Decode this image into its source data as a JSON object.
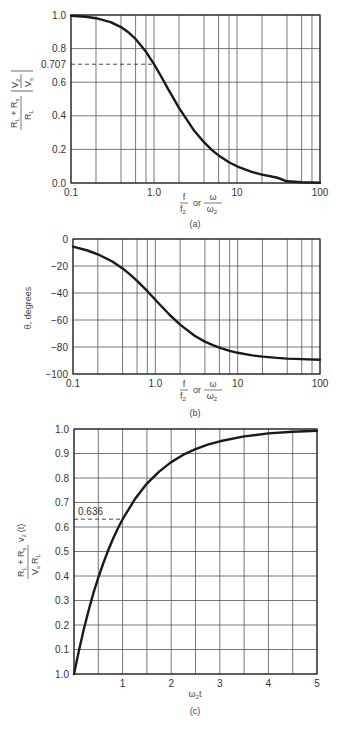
{
  "chart_data": [
    {
      "id": "a",
      "type": "line",
      "title": "",
      "caption": "(a)",
      "xscale": "log",
      "xlim": [
        0.1,
        100
      ],
      "ylim": [
        0.0,
        1.0
      ],
      "xticks": [
        {
          "v": 0.1,
          "label": "0.1"
        },
        {
          "v": 1,
          "label": "1.0"
        },
        {
          "v": 10,
          "label": "10"
        },
        {
          "v": 100,
          "label": "100"
        }
      ],
      "xgrid": [
        0.1,
        0.2,
        0.4,
        0.6,
        0.8,
        1,
        2,
        4,
        6,
        8,
        10,
        20,
        40,
        60,
        80,
        100
      ],
      "yticks": [
        {
          "v": 1.0,
          "label": "1.0"
        },
        {
          "v": 0.8,
          "label": "0.8"
        },
        {
          "v": 0.707,
          "label": "0.707"
        },
        {
          "v": 0.6,
          "label": "0.6"
        },
        {
          "v": 0.4,
          "label": "0.4"
        },
        {
          "v": 0.2,
          "label": "0.2"
        },
        {
          "v": 0.0,
          "label": "0.0"
        }
      ],
      "ygrid": [
        0.0,
        0.2,
        0.4,
        0.6,
        0.8,
        1.0
      ],
      "xlabel": "f/f2 or ω/ω2",
      "xlabel_parts": {
        "num1": "f",
        "den1": "f",
        "den1_sub": "2",
        "or": "or",
        "num2": "ω",
        "den2": "ω",
        "den2_sub": "2"
      },
      "ylabel": "(RL + Rs)/RL |V2/Vs|",
      "ylabel_parts": {
        "num": "R",
        "num_sub1": "L",
        "plus": " + R",
        "num_sub2": "s",
        "den": "R",
        "den_sub": "L",
        "abs_num": "V",
        "abs_num_sub": "2",
        "abs_den": "V",
        "abs_den_sub": "s"
      },
      "annotations": [
        {
          "text": "0.707",
          "type": "dashed-hline",
          "y": 0.707,
          "x_end": 1.0
        }
      ],
      "series": [
        {
          "name": "normalized magnitude",
          "x": [
            0.1,
            0.15,
            0.2,
            0.3,
            0.4,
            0.5,
            0.6,
            0.8,
            1.0,
            1.2,
            1.5,
            2,
            3,
            4,
            5,
            6,
            8,
            10,
            15,
            20,
            30,
            40,
            60,
            100
          ],
          "y": [
            0.995,
            0.989,
            0.981,
            0.958,
            0.928,
            0.894,
            0.857,
            0.781,
            0.707,
            0.64,
            0.555,
            0.447,
            0.316,
            0.243,
            0.196,
            0.164,
            0.124,
            0.0995,
            0.066,
            0.05,
            0.033,
            0.01,
            0.005,
            0.002
          ]
        }
      ]
    },
    {
      "id": "b",
      "type": "line",
      "title": "",
      "caption": "(b)",
      "xscale": "log",
      "xlim": [
        0.1,
        100
      ],
      "ylim": [
        -100,
        0
      ],
      "xticks": [
        {
          "v": 0.1,
          "label": "0.1"
        },
        {
          "v": 1,
          "label": "1.0"
        },
        {
          "v": 10,
          "label": "10"
        },
        {
          "v": 100,
          "label": "100"
        }
      ],
      "xgrid": [
        0.1,
        0.2,
        0.4,
        0.6,
        0.8,
        1,
        2,
        4,
        6,
        8,
        10,
        20,
        40,
        60,
        80,
        100
      ],
      "yticks": [
        {
          "v": 0,
          "label": "0"
        },
        {
          "v": -20,
          "label": "−20"
        },
        {
          "v": -40,
          "label": "−40"
        },
        {
          "v": -60,
          "label": "−60"
        },
        {
          "v": -80,
          "label": "−80"
        },
        {
          "v": -100,
          "label": "−100"
        }
      ],
      "ygrid": [
        0,
        -20,
        -40,
        -60,
        -80,
        -100
      ],
      "xlabel": "f/f2 or ω/ω2",
      "xlabel_parts": {
        "num1": "f",
        "den1": "f",
        "den1_sub": "2",
        "or": "or",
        "num2": "ω",
        "den2": "ω",
        "den2_sub": "2"
      },
      "ylabel": "θ, degrees",
      "series": [
        {
          "name": "phase",
          "x": [
            0.1,
            0.15,
            0.2,
            0.3,
            0.4,
            0.5,
            0.6,
            0.8,
            1.0,
            1.2,
            1.5,
            2,
            3,
            4,
            5,
            6,
            8,
            10,
            15,
            20,
            30,
            40,
            60,
            100
          ],
          "y": [
            -5.7,
            -8.5,
            -11.3,
            -16.7,
            -21.8,
            -26.6,
            -31.0,
            -38.7,
            -45.0,
            -50.2,
            -56.3,
            -63.4,
            -71.6,
            -76.0,
            -78.7,
            -80.5,
            -82.9,
            -84.3,
            -86.2,
            -87.1,
            -88.1,
            -88.6,
            -89.0,
            -89.4
          ]
        }
      ]
    },
    {
      "id": "c",
      "type": "line",
      "title": "",
      "caption": "(c)",
      "xscale": "linear",
      "xlim": [
        0,
        5
      ],
      "ylim": [
        0.0,
        1.0
      ],
      "xticks": [
        {
          "v": 1,
          "label": "1"
        },
        {
          "v": 2,
          "label": "2"
        },
        {
          "v": 3,
          "label": "3"
        },
        {
          "v": 4,
          "label": "4"
        },
        {
          "v": 5,
          "label": "5"
        }
      ],
      "xgrid": [
        0,
        0.5,
        1,
        1.5,
        2,
        2.5,
        3,
        3.5,
        4,
        4.5,
        5
      ],
      "yticks": [
        {
          "v": 1.0,
          "label": "1.0"
        },
        {
          "v": 0.9,
          "label": "0.9"
        },
        {
          "v": 0.8,
          "label": "0.8"
        },
        {
          "v": 0.7,
          "label": "0.7"
        },
        {
          "v": 0.6,
          "label": "0.6"
        },
        {
          "v": 0.5,
          "label": "0.5"
        },
        {
          "v": 0.4,
          "label": "0.4"
        },
        {
          "v": 0.3,
          "label": "0.3"
        },
        {
          "v": 0.2,
          "label": "0.2"
        },
        {
          "v": 0.1,
          "label": "0.1"
        },
        {
          "v": 0.0,
          "label": "1.0"
        }
      ],
      "ygrid": [
        0,
        0.1,
        0.2,
        0.3,
        0.4,
        0.5,
        0.6,
        0.7,
        0.8,
        0.9,
        1.0
      ],
      "xlabel": "ω2t",
      "xlabel_parts": {
        "main": "ω",
        "sub": "2",
        "tail": "t"
      },
      "ylabel": "(RL + Rs)/(Vs RL) v2(t)",
      "ylabel_parts": {
        "num": "R",
        "num_sub1": "L",
        "plus": " + R",
        "num_sub2": "s",
        "den": "V",
        "den_sub1": "s",
        "den2": "R",
        "den_sub2": "L",
        "v": "v",
        "v_sub": "2",
        "t": "(t)"
      },
      "annotations": [
        {
          "text": "0.636",
          "type": "dashed-hline",
          "y": 0.632,
          "x_end": 1.0
        }
      ],
      "series": [
        {
          "name": "step response",
          "x": [
            0,
            0.1,
            0.2,
            0.3,
            0.4,
            0.5,
            0.6,
            0.7,
            0.8,
            0.9,
            1.0,
            1.25,
            1.5,
            1.75,
            2.0,
            2.25,
            2.5,
            2.75,
            3.0,
            3.5,
            4.0,
            4.5,
            5.0
          ],
          "y": [
            0.0,
            0.095,
            0.181,
            0.259,
            0.33,
            0.393,
            0.451,
            0.503,
            0.551,
            0.593,
            0.632,
            0.713,
            0.777,
            0.826,
            0.865,
            0.895,
            0.918,
            0.936,
            0.95,
            0.97,
            0.982,
            0.989,
            0.993
          ]
        }
      ]
    }
  ],
  "layout": {
    "a": {
      "x0": 71,
      "x1": 320,
      "y0": 15,
      "y1": 183
    },
    "b": {
      "x0": 73,
      "x1": 320,
      "y0": 239,
      "y1": 374
    },
    "c": {
      "x0": 74,
      "x1": 317,
      "y0": 429,
      "y1": 674
    }
  }
}
